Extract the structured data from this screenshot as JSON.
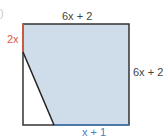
{
  "diagram": {
    "type": "geometry-square-with-shaded-region",
    "colors": {
      "shaded": "#cfdcea",
      "outline": "#333333",
      "highlight_left": "#e05a3a",
      "highlight_bottom": "#4a7fc0"
    },
    "labels": {
      "top": "6x + 2",
      "right": "6x + 2",
      "left_segment": "2x",
      "bottom_segment": "x + 1",
      "fragment": ")"
    },
    "geometry": {
      "square": {
        "x1": 23,
        "y1": 24,
        "x2": 129,
        "y2": 125
      },
      "left_red_segment_end_y": 52,
      "diagonal": {
        "from": [
          23,
          52
        ],
        "to": [
          54,
          125
        ]
      }
    }
  }
}
